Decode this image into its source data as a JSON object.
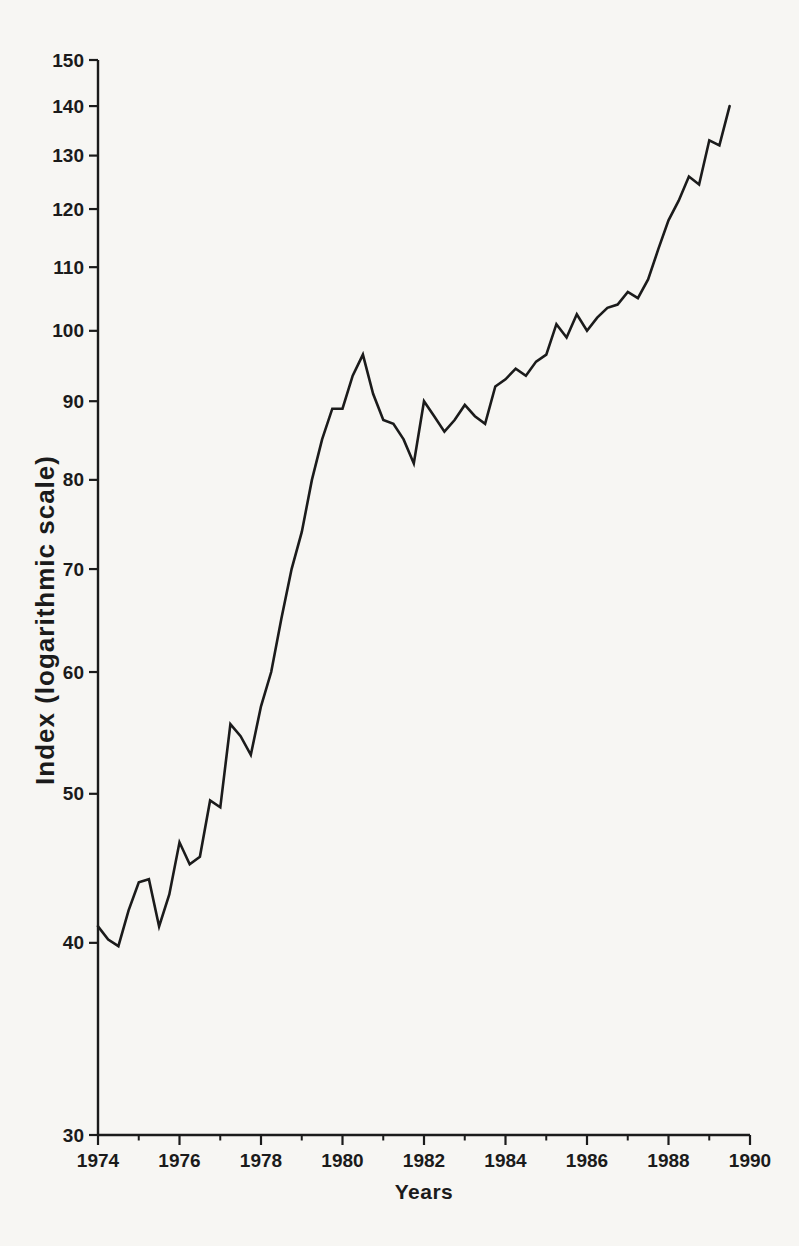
{
  "page": {
    "background": "#f7f6f3",
    "ink": "#1b1b1b"
  },
  "chart_data": {
    "type": "line",
    "title": "",
    "xlabel": "Years",
    "ylabel": "Index (logarithmic scale)",
    "y_scale": "logarithmic",
    "grid": "off",
    "legend": "none",
    "xlim": [
      1974,
      1990
    ],
    "ylim": [
      30,
      150
    ],
    "y_ticks": [
      30,
      40,
      50,
      60,
      70,
      80,
      90,
      100,
      110,
      120,
      130,
      140,
      150
    ],
    "x_ticks_major": [
      1974,
      1976,
      1978,
      1980,
      1982,
      1984,
      1986,
      1988,
      1990
    ],
    "x_ticks_minor": [
      1975,
      1977,
      1979,
      1981,
      1983,
      1985,
      1987,
      1989
    ],
    "series": [
      {
        "name": "Index",
        "color": "#1b1b1b",
        "x_start": 1974.0,
        "x_step": 0.25,
        "frequency": "quarterly",
        "values": [
          41,
          40.2,
          39.8,
          42,
          43.8,
          44,
          41,
          43,
          46.5,
          45,
          45.5,
          49.5,
          49,
          55.5,
          54.5,
          53,
          57,
          60,
          65,
          70,
          74,
          80,
          85,
          89,
          89,
          93.5,
          96.5,
          91,
          87.5,
          87,
          85,
          82,
          90,
          88,
          86,
          87.5,
          89.5,
          88,
          87,
          92,
          93,
          94.5,
          93.5,
          95.5,
          96.5,
          101,
          99,
          102.5,
          100,
          102,
          103.5,
          104,
          106,
          105,
          108,
          113,
          118,
          121.5,
          126,
          124.5,
          133,
          132,
          140
        ]
      }
    ]
  }
}
